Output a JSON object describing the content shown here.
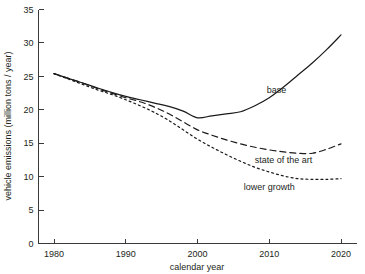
{
  "chart_data": {
    "type": "line",
    "title": "",
    "xlabel": "calendar year",
    "ylabel": "vehicle emissions (million tons / year)",
    "xlim": [
      1978,
      2021
    ],
    "ylim": [
      0,
      35
    ],
    "xticks": [
      1980,
      1990,
      2000,
      2010,
      2020
    ],
    "xtick_labels": [
      "1980",
      "1990",
      "2000",
      "2010",
      "2020"
    ],
    "yticks": [
      0,
      5,
      10,
      15,
      20,
      25,
      30,
      35
    ],
    "ytick_labels": [
      "0",
      "5",
      "10",
      "15",
      "20",
      "25",
      "30",
      "35"
    ],
    "grid": false,
    "legend_position": "inline-annotations",
    "x": [
      1980,
      1982,
      1984,
      1986,
      1988,
      1990,
      1992,
      1994,
      1996,
      1998,
      2000,
      2002,
      2004,
      2006,
      2008,
      2010,
      2012,
      2014,
      2016,
      2018,
      2020
    ],
    "series": [
      {
        "name": "base",
        "style": "solid",
        "label_x": 2011,
        "label_y": 22.5,
        "values": [
          25.4,
          24.7,
          24.0,
          23.3,
          22.6,
          22.0,
          21.5,
          21.0,
          20.5,
          19.8,
          18.8,
          19.1,
          19.4,
          19.7,
          20.6,
          21.8,
          23.4,
          25.2,
          27.0,
          29.0,
          31.2
        ]
      },
      {
        "name": "state of the art",
        "style": "dashed",
        "label_x": 2012,
        "label_y": 12.1,
        "values": [
          25.4,
          24.7,
          24.0,
          23.2,
          22.5,
          21.8,
          21.2,
          20.4,
          19.4,
          18.2,
          17.0,
          16.2,
          15.5,
          14.9,
          14.4,
          14.0,
          13.7,
          13.5,
          13.5,
          14.1,
          14.9
        ]
      },
      {
        "name": "lower growth",
        "style": "dotted",
        "label_x": 2010,
        "label_y": 8.0,
        "values": [
          25.4,
          24.6,
          23.8,
          23.0,
          22.3,
          21.5,
          20.6,
          19.6,
          18.4,
          17.0,
          15.6,
          14.4,
          13.3,
          12.3,
          11.4,
          10.7,
          10.1,
          9.7,
          9.6,
          9.6,
          9.7
        ]
      }
    ]
  }
}
